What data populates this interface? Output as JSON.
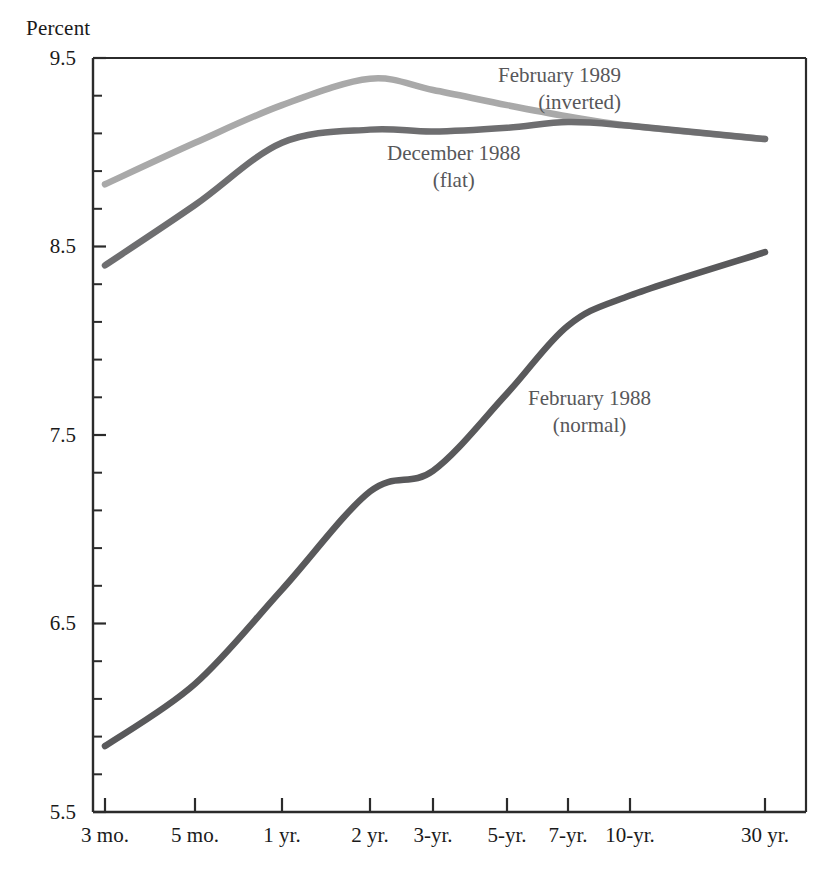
{
  "chart_data": {
    "type": "line",
    "title": "",
    "ylabel": "Percent",
    "xlabel": "",
    "ylim": [
      5.5,
      9.5
    ],
    "ytick_labels": [
      "9.5",
      "8.5",
      "7.5",
      "6.5",
      "5.5"
    ],
    "ytick_values": [
      9.5,
      8.5,
      7.5,
      6.5,
      5.5
    ],
    "yminor_step": 0.2,
    "grid": false,
    "legend_position": "inline-annotations",
    "categories": [
      "3 mo.",
      "5 mo.",
      "1 yr.",
      "2 yr.",
      "3-yr.",
      "5-yr.",
      "7-yr.",
      "10-yr.",
      "30 yr."
    ],
    "series": [
      {
        "name": "February 1989",
        "subtitle": "(inverted)",
        "color": "#a9a9a9",
        "values": [
          8.83,
          9.05,
          9.25,
          9.39,
          9.33,
          9.25,
          9.19,
          9.14,
          9.07
        ]
      },
      {
        "name": "December 1988",
        "subtitle": "(flat)",
        "color": "#6e6e70",
        "values": [
          8.4,
          8.72,
          9.05,
          9.12,
          9.11,
          9.13,
          9.16,
          9.14,
          9.07
        ]
      },
      {
        "name": "February 1988",
        "subtitle": "(normal)",
        "color": "#59595b",
        "values": [
          5.85,
          6.18,
          6.68,
          7.2,
          7.31,
          7.72,
          8.08,
          8.24,
          8.47
        ]
      }
    ]
  },
  "annotations": [
    {
      "label": "February 1989",
      "sub": "(inverted)"
    },
    {
      "label": "December 1988",
      "sub": "(flat)"
    },
    {
      "label": "February 1988",
      "sub": "(normal)"
    }
  ]
}
